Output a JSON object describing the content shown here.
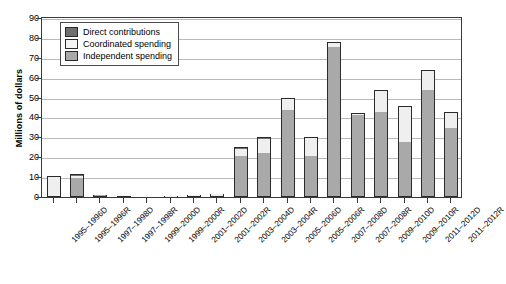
{
  "chart_data": {
    "type": "bar",
    "stacked": true,
    "title": "",
    "xlabel": "",
    "ylabel": "Millions of dollars",
    "ylim": [
      0,
      90
    ],
    "yticks": [
      0,
      10,
      20,
      30,
      40,
      50,
      60,
      70,
      80,
      90
    ],
    "grid": true,
    "legend_position": "top-left",
    "legend": [
      "Direct contributions",
      "Coordinated spending",
      "Independent spending"
    ],
    "colors": {
      "direct_contributions": "#6f6f6f",
      "coordinated_spending": "#efefef",
      "independent_spending": "#a9a9a9",
      "outline": "#2b2b2b",
      "gridline": "#b9b9b9",
      "axis": "#3a3a3a"
    },
    "categories": [
      "1995–1996D",
      "1995–1996R",
      "1997–1998D",
      "1997–1998R",
      "1999–2000D",
      "1999–2000R",
      "2001–2002D",
      "2001–2002R",
      "2003–2004D",
      "2003–2004R",
      "2005–2006D",
      "2005–2006R",
      "2007–2008D",
      "2007–2008R",
      "2009–2010D",
      "2009–2010R",
      "2011–2012D",
      "2011–2012R"
    ],
    "series": [
      {
        "name": "Independent spending",
        "values": [
          0.5,
          9.8,
          1.2,
          0.4,
          0.2,
          0.3,
          0.4,
          0.7,
          20.5,
          22.0,
          43.5,
          20.5,
          75.5,
          41.0,
          42.5,
          27.5,
          54.0,
          34.5
        ]
      },
      {
        "name": "Coordinated spending",
        "values": [
          9.6,
          1.0,
          0.3,
          0.3,
          0.3,
          0.4,
          0.4,
          0.7,
          3.7,
          7.2,
          6.0,
          9.0,
          2.0,
          0.6,
          11.0,
          18.0,
          9.5,
          7.8
        ]
      },
      {
        "name": "Direct contributions",
        "values": [
          0.4,
          0.7,
          0.3,
          0.2,
          0.2,
          0.2,
          0.2,
          0.2,
          0.8,
          0.8,
          0.5,
          0.5,
          0.5,
          0.4,
          0.5,
          0.5,
          0.5,
          0.7
        ]
      }
    ],
    "totals": [
      10.5,
      11.5,
      1.8,
      0.9,
      0.7,
      0.9,
      1.0,
      1.6,
      25.0,
      30.0,
      50.0,
      30.0,
      78.0,
      42.0,
      54.0,
      46.0,
      64.0,
      43.0
    ]
  }
}
